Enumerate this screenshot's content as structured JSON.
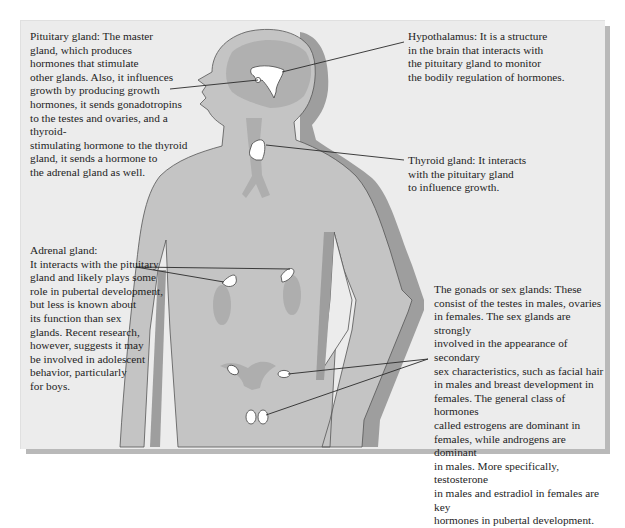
{
  "figure": {
    "colors": {
      "background": "#ffffff",
      "panel": "#ececec",
      "panel_shadow": "#b9b9b9",
      "body": "#c4c4c4",
      "body_shadow": "#9e9e9e",
      "organ_tint": "#aeaeae",
      "gland_fill": "#ffffff",
      "leader_line": "#2a2a2a"
    },
    "glands": [
      {
        "id": "pituitary",
        "name": "Pituitary gland",
        "location": "head"
      },
      {
        "id": "hypothalamus",
        "name": "Hypothalamus",
        "location": "head"
      },
      {
        "id": "thyroid",
        "name": "Thyroid gland",
        "location": "neck"
      },
      {
        "id": "adrenal",
        "name": "Adrenal gland",
        "location": "abdomen"
      },
      {
        "id": "gonads",
        "name": "The gonads or sex glands",
        "location": "pelvis"
      }
    ]
  },
  "labels": {
    "pituitary": "Pituitary gland:  The master\ngland, which produces\nhormones that stimulate\nother glands.  Also, it influences\ngrowth by producing growth\nhormones, it sends gonadotropins\nto the testes and ovaries, and a thyroid-\nstimulating hormone to the thyroid\ngland, it sends a hormone to\nthe adrenal gland as well.",
    "hypothalamus": "Hypothalamus:  It is a structure\nin the brain that interacts with\nthe pituitary gland to monitor\nthe bodily regulation of hormones.",
    "thyroid": "Thyroid gland:  It interacts\nwith the pituitary gland\nto influence growth.",
    "adrenal": "Adrenal gland:\nIt interacts with the pituitary\ngland and likely plays some\nrole in pubertal development,\nbut less is known about\nits function than sex\nglands.  Recent research,\nhowever, suggests it may\nbe involved in adolescent\nbehavior, particularly\nfor boys.",
    "gonads": "The gonads or sex glands: These\nconsist of the testes in males, ovaries\nin females.  The sex glands are strongly\ninvolved in the appearance of secondary\nsex characteristics, such as facial hair\nin males and breast development in\nfemales.  The general class of hormones\ncalled estrogens are dominant in\nfemales, while androgens are  dominant\nin males.  More specifically, testosterone\nin males and estradiol in females are key\nhormones in pubertal development."
  }
}
